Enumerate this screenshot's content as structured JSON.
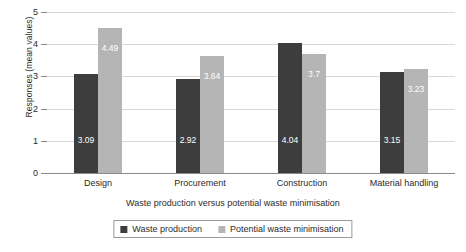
{
  "chart_data": {
    "type": "bar",
    "title": "",
    "xlabel": "Waste production versus potential waste minimisation",
    "ylabel": "Responses (mean values)",
    "categories": [
      "Design",
      "Procurement",
      "Construction",
      "Material handling"
    ],
    "series": [
      {
        "name": "Waste production",
        "color": "#3d3d3d",
        "values": [
          3.09,
          2.92,
          4.04,
          3.15
        ],
        "labels": [
          "3.09",
          "2.92",
          "4.04",
          "3.15"
        ]
      },
      {
        "name": "Potential waste minimisation",
        "color": "#b5b5b5",
        "values": [
          4.49,
          3.64,
          3.7,
          3.23
        ],
        "labels": [
          "4.49",
          "3.64",
          "3.7",
          "3.23"
        ]
      }
    ],
    "ylim": [
      0,
      5
    ],
    "yticks": [
      0,
      1,
      2,
      3,
      4,
      5
    ],
    "ytick_labels": [
      "0",
      "1",
      "2",
      "3",
      "4",
      "5"
    ],
    "grid": true,
    "grid_axis": "y",
    "legend_position": "bottom",
    "bar_value_label_color": "#ffffff"
  },
  "colors": {
    "series_0": "#3d3d3d",
    "series_1": "#b5b5b5",
    "gridline": "#d8d8d8",
    "axis": "#8a8a8a",
    "text": "#2b2b2b",
    "background": "#ffffff"
  }
}
